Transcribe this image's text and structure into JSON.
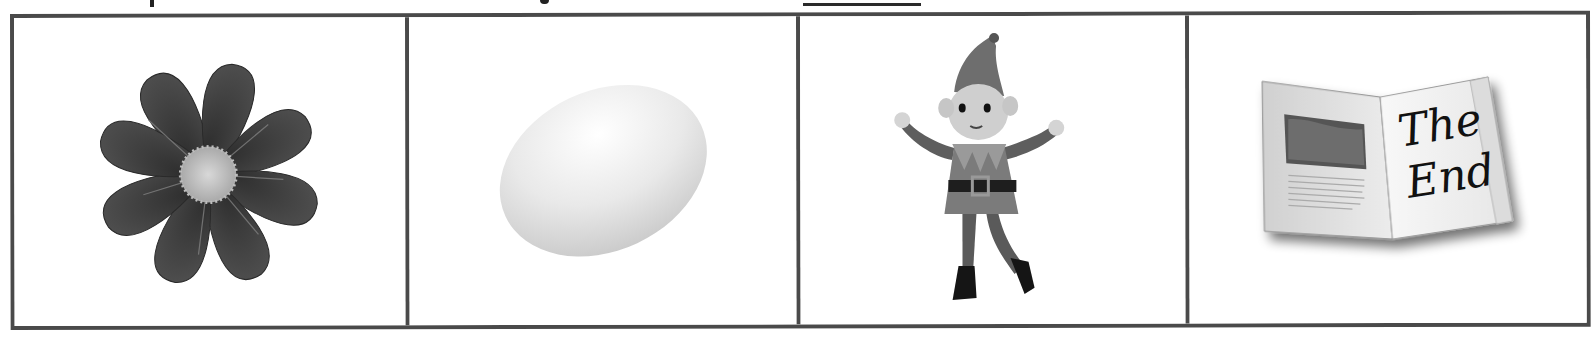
{
  "worksheet": {
    "instruction_line": {
      "visible": "clipped",
      "text": "",
      "has_answer_blank": true
    },
    "picture_cells": [
      {
        "label": "flower",
        "description": "cosmos flower"
      },
      {
        "label": "egg",
        "description": "white egg"
      },
      {
        "label": "elf",
        "description": "elf doll"
      },
      {
        "label": "book",
        "description": "open book"
      },
      {
        "book_text_line1": "The",
        "book_text_line2": "End"
      }
    ],
    "book_text": {
      "line1": "The",
      "line2": "End"
    },
    "colors": {
      "border": "#4a4a4a",
      "background": "#ffffff",
      "ink": "#222222"
    }
  }
}
